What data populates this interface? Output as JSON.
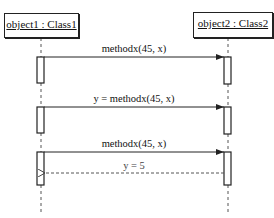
{
  "diagram": {
    "type": "sequence",
    "lifelines": [
      {
        "id": "object1",
        "label": "object1 : Class1"
      },
      {
        "id": "object2",
        "label": "object2 : Class2"
      }
    ],
    "messages": [
      {
        "from": "object1",
        "to": "object2",
        "label": "methodx(45, x)",
        "kind": "call"
      },
      {
        "from": "object1",
        "to": "object2",
        "label": "y = methodx(45, x)",
        "kind": "call"
      },
      {
        "from": "object1",
        "to": "object2",
        "label": "methodx(45, x)",
        "kind": "call"
      },
      {
        "from": "object2",
        "to": "object1",
        "label": "y = 5",
        "kind": "return"
      }
    ]
  }
}
